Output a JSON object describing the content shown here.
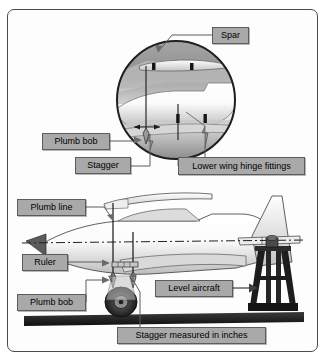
{
  "figure": {
    "background_color": "#ffffff",
    "frame_color": "#4b4b4b",
    "label_fill": "#a9a9a9",
    "label_border": "#5c5c5c",
    "label_text_color": "#000000"
  },
  "detail_view": {
    "name": "circular-detail-inset",
    "shape": "circle",
    "labels": [
      {
        "id": "spar",
        "text": "Spar",
        "x": 212,
        "y": 27,
        "w": 37,
        "h": 17
      },
      {
        "id": "plumb-bob-detail",
        "text": "Plumb bob",
        "x": 42,
        "y": 133,
        "w": 68,
        "h": 17
      },
      {
        "id": "stagger",
        "text": "Stagger",
        "x": 75,
        "y": 157,
        "w": 56,
        "h": 17
      },
      {
        "id": "lower-wing-hinge-fittings",
        "text": "Lower wing hinge fittings",
        "x": 178,
        "y": 157,
        "w": 127,
        "h": 18
      }
    ]
  },
  "side_view": {
    "name": "aircraft-side-elevation",
    "labels": [
      {
        "id": "plumb-line",
        "text": "Plumb line",
        "x": 17,
        "y": 199,
        "w": 69,
        "h": 17
      },
      {
        "id": "ruler",
        "text": "Ruler",
        "x": 22,
        "y": 254,
        "w": 46,
        "h": 17
      },
      {
        "id": "plumb-bob-side",
        "text": "Plumb bob",
        "x": 17,
        "y": 294,
        "w": 69,
        "h": 17
      },
      {
        "id": "level-aircraft",
        "text": "Level aircraft",
        "x": 155,
        "y": 280,
        "w": 78,
        "h": 17
      },
      {
        "id": "stagger-measured-in-inches",
        "text": "Stagger measured in inches",
        "x": 117,
        "y": 327,
        "w": 149,
        "h": 17
      }
    ]
  }
}
